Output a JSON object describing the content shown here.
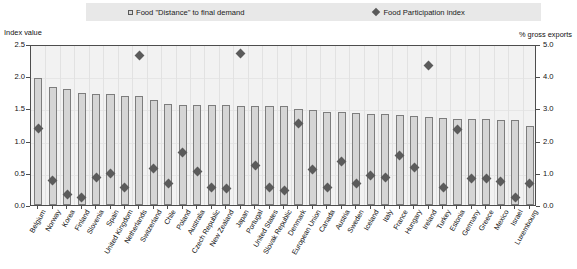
{
  "legend": {
    "items": [
      {
        "label": "Food \"Distance\" to final demand",
        "icon": "square-swatch-icon",
        "type": "bar"
      },
      {
        "label": "Food Participation index",
        "icon": "diamond-marker-icon",
        "type": "marker"
      }
    ]
  },
  "axes": {
    "left_caption": "Index value",
    "right_caption": "% gross exports",
    "left_ticks": [
      "2.5",
      "2.0",
      "1.5",
      "1.0",
      "0.5",
      "0.0"
    ],
    "right_ticks": [
      "5.0",
      "4.0",
      "3.0",
      "2.0",
      "1.0",
      "0.0"
    ]
  },
  "chart_data": {
    "type": "bar",
    "title": "",
    "subtitle": "",
    "xlabel": "",
    "ylabel": "Index value",
    "y2label": "% gross exports",
    "ylim": [
      0.0,
      2.5
    ],
    "y2lim": [
      0.0,
      5.0
    ],
    "grid": true,
    "legend_position": "top",
    "categories": [
      "Belgium",
      "Norway",
      "Korea",
      "Finland",
      "Slovenia",
      "Spain",
      "United Kingdom",
      "Netherlands",
      "Switzerland",
      "Chile",
      "Poland",
      "Australia",
      "Czech Republic",
      "New Zealand",
      "Japan",
      "Portugal",
      "United States",
      "Slovak Republic",
      "Denmark",
      "European Union",
      "Canada",
      "Austria",
      "Sweden",
      "Iceland",
      "Italy",
      "France",
      "Hungary",
      "Ireland",
      "Turkey",
      "Estonia",
      "Germany",
      "Greece",
      "Mexico",
      "Israel",
      "Luxembourg"
    ],
    "series": [
      {
        "name": "Food \"Distance\" to final demand",
        "axis": "left",
        "values": [
          1.97,
          1.84,
          1.8,
          1.74,
          1.72,
          1.73,
          1.7,
          1.69,
          1.63,
          1.57,
          1.56,
          1.55,
          1.56,
          1.55,
          1.54,
          1.54,
          1.53,
          1.53,
          1.49,
          1.48,
          1.45,
          1.44,
          1.43,
          1.42,
          1.41,
          1.4,
          1.38,
          1.37,
          1.35,
          1.34,
          1.33,
          1.33,
          1.32,
          1.32,
          1.22
        ]
      },
      {
        "name": "Food Participation index",
        "axis": "right",
        "values": [
          2.45,
          0.82,
          0.38,
          0.3,
          0.92,
          1.05,
          0.62,
          4.7,
          1.2,
          0.72,
          1.7,
          1.1,
          0.62,
          0.58,
          4.78,
          1.3,
          0.62,
          0.52,
          2.6,
          1.18,
          0.62,
          1.4,
          0.74,
          0.98,
          0.92,
          1.6,
          1.22,
          4.4,
          0.62,
          2.4,
          0.88,
          0.9,
          0.78,
          0.3,
          0.72
        ]
      }
    ]
  }
}
